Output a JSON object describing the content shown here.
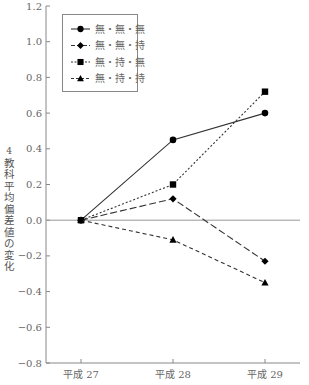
{
  "chart_data": {
    "type": "line",
    "title": "",
    "xlabel": "",
    "ylabel": "4教科平均偏差値の変化",
    "categories": [
      "平成 27",
      "平成 28",
      "平成 29"
    ],
    "ylim": [
      -0.8,
      1.2
    ],
    "yticks": [
      -0.8,
      -0.6,
      -0.4,
      -0.2,
      0.0,
      0.2,
      0.4,
      0.6,
      0.8,
      1.0,
      1.2
    ],
    "ytick_labels": [
      "−0.8",
      "−0.6",
      "−0.4",
      "−0.2",
      "0.0",
      "0.2",
      "0.4",
      "0.6",
      "0.8",
      "1.0",
      "1.2"
    ],
    "grid": false,
    "reference_line": 0.0,
    "legend_position": "upper left",
    "series": [
      {
        "name": "無・無・無",
        "values": [
          0.0,
          0.45,
          0.6
        ],
        "marker": "circle",
        "line": "solid"
      },
      {
        "name": "無・無・持",
        "values": [
          0.0,
          0.12,
          -0.23
        ],
        "marker": "diamond",
        "line": "long-dash"
      },
      {
        "name": "無・持・無",
        "values": [
          0.0,
          0.2,
          0.72
        ],
        "marker": "square",
        "line": "dotted"
      },
      {
        "name": "無・持・持",
        "values": [
          0.0,
          -0.11,
          -0.35
        ],
        "marker": "triangle",
        "line": "short-dash"
      }
    ]
  }
}
